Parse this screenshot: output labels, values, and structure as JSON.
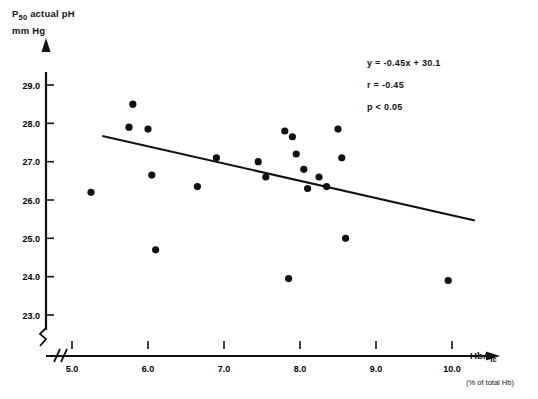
{
  "chart_data": {
    "type": "scatter",
    "title": "",
    "ylabel_line1": "P50 actual pH",
    "ylabel_line1_main": "P",
    "ylabel_line1_sub": "50",
    "ylabel_line1_rest": "actual pH",
    "ylabel_line2": "mm Hg",
    "xlabel_main": "HbA",
    "xlabel_sub": "Ic",
    "xlabel_note": "(% of total Hb)",
    "xlim": [
      4.6,
      10.6
    ],
    "ylim": [
      22.6,
      29.4
    ],
    "xticks": [
      5.0,
      6.0,
      7.0,
      8.0,
      9.0,
      10.0
    ],
    "xtick_labels": [
      "5.0",
      "6.0",
      "7.0",
      "8.0",
      "9.0",
      "10.0"
    ],
    "yticks": [
      23.0,
      24.0,
      25.0,
      26.0,
      27.0,
      28.0,
      29.0
    ],
    "ytick_labels": [
      "23.0",
      "24.0",
      "25.0",
      "26.0",
      "27.0",
      "28.0",
      "29.0"
    ],
    "grid": false,
    "axis_break_x": true,
    "axis_break_y": true,
    "marker_color": "#111111",
    "line_color": "#111111",
    "points": [
      {
        "x": 5.25,
        "y": 26.2
      },
      {
        "x": 5.75,
        "y": 27.9
      },
      {
        "x": 5.8,
        "y": 28.5
      },
      {
        "x": 6.0,
        "y": 27.85
      },
      {
        "x": 6.05,
        "y": 26.65
      },
      {
        "x": 6.1,
        "y": 24.7
      },
      {
        "x": 6.65,
        "y": 26.35
      },
      {
        "x": 6.9,
        "y": 27.1
      },
      {
        "x": 7.45,
        "y": 27.0
      },
      {
        "x": 7.55,
        "y": 26.6
      },
      {
        "x": 7.8,
        "y": 27.8
      },
      {
        "x": 7.85,
        "y": 23.95
      },
      {
        "x": 7.9,
        "y": 27.65
      },
      {
        "x": 7.95,
        "y": 27.2
      },
      {
        "x": 8.05,
        "y": 26.8
      },
      {
        "x": 8.1,
        "y": 26.3
      },
      {
        "x": 8.25,
        "y": 26.6
      },
      {
        "x": 8.35,
        "y": 26.35
      },
      {
        "x": 8.5,
        "y": 27.85
      },
      {
        "x": 8.55,
        "y": 27.1
      },
      {
        "x": 8.6,
        "y": 25.0
      },
      {
        "x": 9.95,
        "y": 23.9
      }
    ],
    "fit_line": {
      "slope": -0.45,
      "intercept": 30.1,
      "x_start": 5.4,
      "x_end": 10.3
    },
    "annotations": {
      "equation": "y = -0.45x + 30.1",
      "correlation": "r = -0.45",
      "pvalue": "p < 0.05"
    }
  }
}
